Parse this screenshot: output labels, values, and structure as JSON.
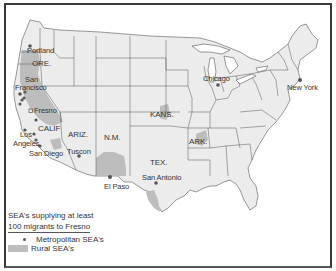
{
  "map": {
    "title": "SEA's supplying at least 100 migrants to Fresno",
    "state_labels": [
      {
        "id": "ore",
        "text": "ORE."
      },
      {
        "id": "calif",
        "text": "CALIF"
      },
      {
        "id": "ariz",
        "text": "ARIZ."
      },
      {
        "id": "nm",
        "text": "N.M."
      },
      {
        "id": "kans",
        "text": "KANS."
      },
      {
        "id": "tex",
        "text": "TEX."
      },
      {
        "id": "ark",
        "text": "ARK."
      }
    ],
    "cities": [
      {
        "id": "portland",
        "text": "Portland"
      },
      {
        "id": "san-francisco-1",
        "text": "San"
      },
      {
        "id": "san-francisco-2",
        "text": "Francisco"
      },
      {
        "id": "fresno",
        "text": "Fresno"
      },
      {
        "id": "los-angeles-1",
        "text": "Los"
      },
      {
        "id": "los-angeles-2",
        "text": "Angeles"
      },
      {
        "id": "san-diego",
        "text": "San Diego"
      },
      {
        "id": "tuscon",
        "text": "Tuscon"
      },
      {
        "id": "el-paso",
        "text": "El Paso"
      },
      {
        "id": "san-antonio",
        "text": "San Antonio"
      },
      {
        "id": "chicago",
        "text": "Chicago"
      },
      {
        "id": "new-york",
        "text": "New York"
      }
    ],
    "colors": {
      "land": "#ececec",
      "rural_sea": "#bdbdbd",
      "border": "#555555",
      "metro_dot": "#555555"
    }
  },
  "legend": {
    "line1": "SEA's supplying at least",
    "line2": "100 migrants to Fresno",
    "items": [
      {
        "symbol": "dot",
        "label": "Metropolitan SEA's"
      },
      {
        "symbol": "swatch",
        "label": "Rural SEA's"
      }
    ]
  }
}
